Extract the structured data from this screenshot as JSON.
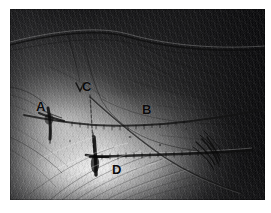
{
  "figure": {
    "type": "photomicrograph",
    "background_color": "#ffffff",
    "plate": {
      "x": 10,
      "y": 9,
      "width": 255,
      "height": 191,
      "border_color": "#000000"
    },
    "lighting": {
      "bright_region": "lower-left to center",
      "dark_region": "upper-right",
      "highlight_color": "#f5f5f5",
      "shadow_color": "#101012"
    },
    "labels": [
      {
        "id": "a",
        "text": "A",
        "x": 26,
        "y": 91,
        "color": "#0b0b0b"
      },
      {
        "id": "b",
        "text": "B",
        "x": 132,
        "y": 94,
        "color": "#0b0b0b"
      },
      {
        "id": "c",
        "text": "C",
        "x": 72,
        "y": 71,
        "color": "#0b0b0b"
      },
      {
        "id": "d",
        "text": "D",
        "x": 102,
        "y": 154,
        "color": "#0b0b0b"
      }
    ],
    "annotation_marks": [
      {
        "name": "upper-chevron-mark",
        "near_label": "C",
        "shape": "v-chevron"
      },
      {
        "name": "suture-knot-a",
        "near_label": "A",
        "shape": "cross-knot"
      },
      {
        "name": "suture-knot-d",
        "near_label": "D",
        "shape": "cross-knot"
      },
      {
        "name": "suture-tail-bundle-right",
        "shape": "frayed-strands"
      }
    ],
    "structures": [
      {
        "name": "upper-horizontal-suture",
        "from_label": "A",
        "to_label": "B",
        "orientation": "horizontal"
      },
      {
        "name": "lower-horizontal-suture",
        "from_label": "D",
        "to_label": "right-edge",
        "orientation": "horizontal"
      },
      {
        "name": "diagonal-strand-c-to-d",
        "from_label": "C",
        "to_label": "lower-right",
        "orientation": "diagonal"
      },
      {
        "name": "vertical-strand-c",
        "from_label": "C",
        "to_label": "D",
        "orientation": "vertical"
      }
    ]
  }
}
